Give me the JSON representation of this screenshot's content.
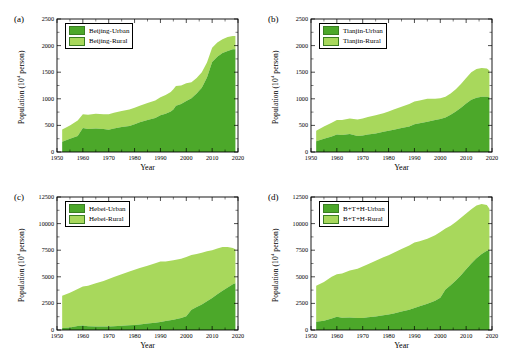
{
  "figure": {
    "axis_label_x": "Year",
    "axis_label_y": "Population (10⁴ person)",
    "colors": {
      "urban": "#4ca82a",
      "rural": "#a8d85c",
      "axis": "#000000",
      "background": "#ffffff"
    }
  },
  "panels": [
    {
      "tag": "(a)",
      "legend": [
        "Beijing-Urban",
        "Beijing-Rural"
      ],
      "ylabel": "Population (10⁴ person)",
      "xlabel": "Year",
      "yticks": [
        "0",
        "500",
        "1000",
        "1500",
        "2000",
        "2500"
      ],
      "xticks": [
        "1950",
        "1960",
        "1970",
        "1980",
        "1990",
        "2000",
        "2010",
        "2020"
      ]
    },
    {
      "tag": "(b)",
      "legend": [
        "Tianjin-Urban",
        "Tianjin-Rural"
      ],
      "ylabel": "Population (10⁴ person)",
      "xlabel": "Year",
      "yticks": [
        "0",
        "500",
        "1000",
        "1500",
        "2000",
        "2500"
      ],
      "xticks": [
        "1950",
        "1960",
        "1970",
        "1980",
        "1990",
        "2000",
        "2010",
        "2020"
      ]
    },
    {
      "tag": "(c)",
      "legend": [
        "Hebei-Urban",
        "Hebei-Rural"
      ],
      "ylabel": "Population (10⁴ person)",
      "xlabel": "Year",
      "yticks": [
        "0",
        "2500",
        "5000",
        "7500",
        "10000",
        "12500"
      ],
      "xticks": [
        "1950",
        "1960",
        "1970",
        "1980",
        "1990",
        "2000",
        "2010",
        "2020"
      ]
    },
    {
      "tag": "(d)",
      "legend": [
        "B+T+H-Urban",
        "B+T+H-Rural"
      ],
      "ylabel": "Population (10⁴ person)",
      "xlabel": "Year",
      "yticks": [
        "0",
        "2500",
        "5000",
        "7500",
        "10000",
        "12500"
      ],
      "xticks": [
        "1950",
        "1960",
        "1970",
        "1980",
        "1990",
        "2000",
        "2010",
        "2020"
      ]
    }
  ],
  "chart_data": [
    {
      "type": "area",
      "panel": "(a)",
      "title": "Beijing",
      "xlabel": "Year",
      "ylabel": "Population (10⁴ person)",
      "xlim": [
        1950,
        2020
      ],
      "ylim": [
        0,
        2500
      ],
      "grid": false,
      "legend_position": "top-left",
      "stacked": true,
      "x": [
        1952,
        1955,
        1958,
        1960,
        1962,
        1965,
        1968,
        1970,
        1972,
        1975,
        1978,
        1980,
        1982,
        1985,
        1988,
        1990,
        1992,
        1994,
        1995,
        1996,
        1998,
        2000,
        2002,
        2004,
        2006,
        2008,
        2010,
        2012,
        2014,
        2016,
        2018,
        2019
      ],
      "series": [
        {
          "name": "Beijing-Urban",
          "color": "#4ca82a",
          "values": [
            195,
            250,
            300,
            450,
            430,
            440,
            430,
            420,
            440,
            470,
            490,
            520,
            560,
            600,
            640,
            690,
            720,
            760,
            800,
            870,
            900,
            960,
            1010,
            1100,
            1210,
            1400,
            1690,
            1790,
            1860,
            1900,
            1930,
            1930
          ]
        },
        {
          "name": "Beijing-Rural",
          "color": "#a8d85c",
          "values": [
            230,
            250,
            290,
            260,
            270,
            280,
            280,
            290,
            300,
            300,
            310,
            310,
            310,
            320,
            330,
            340,
            350,
            370,
            380,
            370,
            350,
            330,
            300,
            290,
            290,
            280,
            270,
            270,
            260,
            260,
            250,
            250
          ]
        }
      ]
    },
    {
      "type": "area",
      "panel": "(b)",
      "title": "Tianjin",
      "xlabel": "Year",
      "ylabel": "Population (10⁴ person)",
      "xlim": [
        1950,
        2020
      ],
      "ylim": [
        0,
        2500
      ],
      "grid": false,
      "legend_position": "top-left",
      "stacked": true,
      "x": [
        1952,
        1955,
        1958,
        1960,
        1962,
        1965,
        1968,
        1970,
        1972,
        1975,
        1978,
        1980,
        1982,
        1985,
        1988,
        1990,
        1992,
        1995,
        1998,
        2000,
        2002,
        2004,
        2006,
        2008,
        2010,
        2012,
        2014,
        2016,
        2018,
        2019
      ],
      "series": [
        {
          "name": "Tianjin-Urban",
          "color": "#4ca82a",
          "values": [
            200,
            250,
            290,
            330,
            320,
            340,
            300,
            310,
            330,
            350,
            380,
            400,
            420,
            450,
            480,
            520,
            540,
            570,
            600,
            620,
            650,
            700,
            760,
            830,
            910,
            980,
            1020,
            1040,
            1040,
            1030
          ]
        },
        {
          "name": "Tianjin-Rural",
          "color": "#a8d85c",
          "values": [
            200,
            230,
            260,
            270,
            280,
            290,
            310,
            320,
            330,
            340,
            350,
            360,
            380,
            400,
            420,
            430,
            430,
            430,
            400,
            390,
            390,
            400,
            420,
            450,
            480,
            520,
            540,
            540,
            530,
            500
          ]
        }
      ]
    },
    {
      "type": "area",
      "panel": "(c)",
      "title": "Hebei",
      "xlabel": "Year",
      "ylabel": "Population (10⁴ person)",
      "xlim": [
        1950,
        2020
      ],
      "ylim": [
        0,
        12500
      ],
      "grid": false,
      "legend_position": "top-left",
      "stacked": true,
      "x": [
        1952,
        1955,
        1958,
        1960,
        1962,
        1965,
        1968,
        1970,
        1972,
        1975,
        1978,
        1980,
        1982,
        1985,
        1988,
        1990,
        1992,
        1995,
        1998,
        2000,
        2002,
        2004,
        2006,
        2008,
        2010,
        2012,
        2014,
        2016,
        2018,
        2019
      ],
      "series": [
        {
          "name": "Hebei-Urban",
          "color": "#4ca82a",
          "values": [
            180,
            230,
            380,
            430,
            350,
            340,
            330,
            340,
            360,
            400,
            440,
            470,
            520,
            600,
            680,
            760,
            840,
            960,
            1120,
            1300,
            1900,
            2150,
            2400,
            2700,
            3000,
            3350,
            3700,
            4000,
            4300,
            4400
          ]
        },
        {
          "name": "Hebei-Rural",
          "color": "#a8d85c",
          "values": [
            3050,
            3280,
            3480,
            3650,
            3800,
            4060,
            4280,
            4450,
            4620,
            4850,
            5060,
            5200,
            5300,
            5450,
            5600,
            5680,
            5600,
            5590,
            5580,
            5560,
            5150,
            5000,
            4850,
            4700,
            4500,
            4300,
            4100,
            3800,
            3400,
            3200
          ]
        }
      ]
    },
    {
      "type": "area",
      "panel": "(d)",
      "title": "Beijing + Tianjin + Hebei",
      "xlabel": "Year",
      "ylabel": "Population (10⁴ person)",
      "xlim": [
        1950,
        2020
      ],
      "ylim": [
        0,
        12500
      ],
      "grid": false,
      "legend_position": "top-left",
      "stacked": true,
      "x": [
        1952,
        1955,
        1958,
        1960,
        1962,
        1965,
        1968,
        1970,
        1972,
        1975,
        1978,
        1980,
        1982,
        1985,
        1988,
        1990,
        1992,
        1995,
        1998,
        2000,
        2002,
        2004,
        2006,
        2008,
        2010,
        2012,
        2014,
        2016,
        2018,
        2019
      ],
      "series": [
        {
          "name": "B+T+H-Urban",
          "color": "#4ca82a",
          "values": [
            780,
            880,
            1090,
            1250,
            1150,
            1180,
            1120,
            1130,
            1190,
            1280,
            1380,
            1450,
            1560,
            1740,
            1900,
            2070,
            2230,
            2460,
            2750,
            3040,
            3800,
            4200,
            4650,
            5150,
            5700,
            6250,
            6750,
            7150,
            7450,
            7500
          ]
        },
        {
          "name": "B+T+H-Rural",
          "color": "#a8d85c",
          "values": [
            3380,
            3620,
            3910,
            4000,
            4150,
            4420,
            4640,
            4830,
            5000,
            5230,
            5450,
            5580,
            5700,
            5880,
            6050,
            6150,
            6100,
            6120,
            6150,
            6180,
            5750,
            5600,
            5500,
            5400,
            5250,
            5100,
            4950,
            4700,
            4300,
            3900
          ]
        }
      ]
    }
  ]
}
